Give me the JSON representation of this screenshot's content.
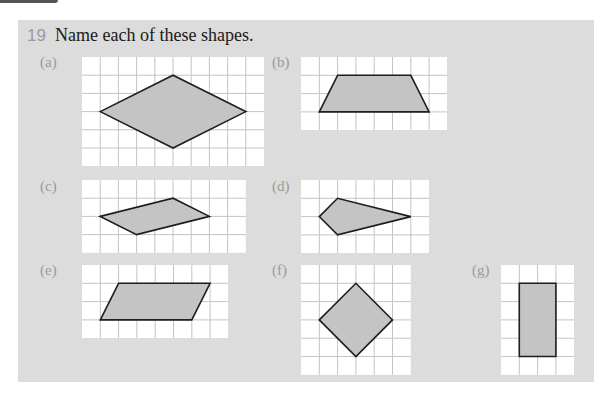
{
  "question": {
    "number": "19",
    "prompt": "Name each of these shapes."
  },
  "colors": {
    "panel": "#dcdcdc",
    "grid_bg": "#ffffff",
    "grid_line": "#c4c4c4",
    "shape_fill": "#c4c4c4",
    "shape_stroke": "#1e1e1e"
  },
  "figures": [
    {
      "label": "(a)",
      "cols": 10,
      "rows": 6,
      "points": [
        [
          1,
          3
        ],
        [
          5,
          1
        ],
        [
          9,
          3
        ],
        [
          5,
          5
        ]
      ]
    },
    {
      "label": "(b)",
      "cols": 8,
      "rows": 4,
      "points": [
        [
          1,
          3
        ],
        [
          2,
          1
        ],
        [
          6,
          1
        ],
        [
          7,
          3
        ]
      ]
    },
    {
      "label": "(c)",
      "cols": 9,
      "rows": 4,
      "points": [
        [
          1,
          2
        ],
        [
          5,
          1
        ],
        [
          7,
          2
        ],
        [
          3,
          3
        ]
      ]
    },
    {
      "label": "(d)",
      "cols": 7,
      "rows": 4,
      "points": [
        [
          1,
          2
        ],
        [
          2,
          1
        ],
        [
          6,
          2
        ],
        [
          2,
          3
        ]
      ]
    },
    {
      "label": "(e)",
      "cols": 8,
      "rows": 4,
      "points": [
        [
          1,
          3
        ],
        [
          2,
          1
        ],
        [
          7,
          1
        ],
        [
          6,
          3
        ]
      ]
    },
    {
      "label": "(f)",
      "cols": 6,
      "rows": 6,
      "points": [
        [
          1,
          3
        ],
        [
          3,
          1
        ],
        [
          5,
          3
        ],
        [
          3,
          5
        ]
      ]
    },
    {
      "label": "(g)",
      "cols": 4,
      "rows": 6,
      "points": [
        [
          1,
          1
        ],
        [
          3,
          1
        ],
        [
          3,
          5
        ],
        [
          1,
          5
        ]
      ]
    }
  ]
}
